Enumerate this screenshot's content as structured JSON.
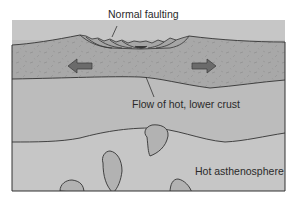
{
  "diagram": {
    "labels": {
      "normal_faulting": "Normal faulting",
      "flow_lower_crust": "Flow of hot, lower crust",
      "hot_asthenosphere": "Hot asthenosphere"
    },
    "layers": [
      {
        "name": "upper-crust",
        "color": "#a9a9a9"
      },
      {
        "name": "lower-crust",
        "color": "#bdbdbd"
      },
      {
        "name": "asthenosphere",
        "color": "#c4c4c4"
      }
    ],
    "arrows": [
      {
        "name": "extension-arrow-left",
        "direction": "left",
        "color": "#6b6b6b"
      },
      {
        "name": "extension-arrow-right",
        "direction": "right",
        "color": "#6b6b6b"
      }
    ],
    "blobs": [
      "rising-melt-1",
      "rising-melt-2",
      "rising-melt-3",
      "rising-melt-4"
    ],
    "colors": {
      "outline": "#333333",
      "blob_fill": "#b0b0b0",
      "background": "#ffffff"
    }
  }
}
